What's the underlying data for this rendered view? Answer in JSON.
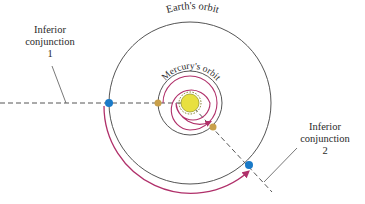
{
  "diagram": {
    "labels": {
      "earth_orbit": "Earth's orbit",
      "mercury_orbit": "Mercury's orbit",
      "conj1_line1": "Inferior",
      "conj1_line2": "conjunction",
      "conj1_line3": "1",
      "conj2_line1": "Inferior",
      "conj2_line2": "conjunction",
      "conj2_line3": "2"
    },
    "colors": {
      "orbit": "#555555",
      "path": "#b0306a",
      "earth": "#1a7ac8",
      "mercury": "#c9a04a",
      "sun": "#e8e040",
      "dash": "#555555"
    }
  }
}
